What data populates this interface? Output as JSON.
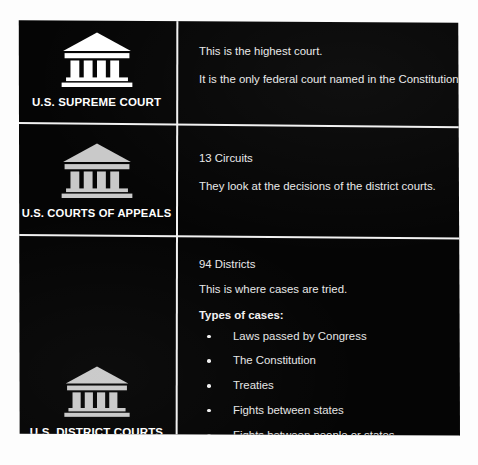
{
  "diagram": {
    "background_color": "#fdfdfd",
    "panel_color": "#050505",
    "text_color": "#e9e9e9",
    "rule_color": "#f2f2f2",
    "rows": [
      {
        "id": "supreme-court",
        "icon": "courthouse-icon",
        "icon_color": "#ffffff",
        "label": "U.S. SUPREME COURT",
        "lines": [
          "This is the highest court.",
          "It is the only federal court named in the Constitution."
        ],
        "list_heading": "",
        "bullets": []
      },
      {
        "id": "courts-of-appeals",
        "icon": "courthouse-icon",
        "icon_color": "#c9c9c9",
        "label": "U.S. COURTS OF APPEALS",
        "lines": [
          "13 Circuits",
          "They look at the decisions of the district courts."
        ],
        "list_heading": "",
        "bullets": []
      },
      {
        "id": "district-courts",
        "icon": "courthouse-icon",
        "icon_color": "#c9c9c9",
        "label": "U.S. DISTRICT COURTS",
        "lines": [
          "94 Districts",
          "This is where cases are tried."
        ],
        "list_heading": "Types of cases:",
        "bullets": [
          "Laws passed by Congress",
          "The Constitution",
          "Treaties",
          "Fights between states",
          "Fights between people or states"
        ]
      }
    ]
  }
}
